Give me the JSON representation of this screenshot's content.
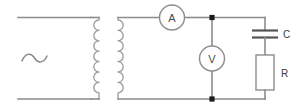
{
  "figure": {
    "background_color": "#ffffff",
    "wire_color": "#8d8d8d",
    "label_color": "#3a3a3a",
    "node_color": "#1a1a1a"
  },
  "source": {
    "name": "ac-source",
    "symbol": "~",
    "description": "alternating current source"
  },
  "transformer": {
    "name": "transformer",
    "primary": {
      "label": "",
      "turns": 8,
      "side": "left"
    },
    "secondary": {
      "label": "",
      "turns": 8,
      "side": "right"
    }
  },
  "meters": [
    {
      "name": "ammeter",
      "label": "A",
      "shape": "circle",
      "placement": "series-top-branch"
    },
    {
      "name": "voltmeter",
      "label": "V",
      "shape": "circle",
      "placement": "parallel-middle-branch"
    }
  ],
  "components": [
    {
      "name": "capacitor",
      "label": "C",
      "symbol": "capacitor-plates",
      "placement": "right-branch-upper"
    },
    {
      "name": "resistor",
      "label": "R",
      "symbol": "resistor-box",
      "placement": "right-branch-lower"
    }
  ],
  "nodes": [
    {
      "name": "node-top",
      "label": ""
    },
    {
      "name": "node-bottom",
      "label": ""
    }
  ]
}
